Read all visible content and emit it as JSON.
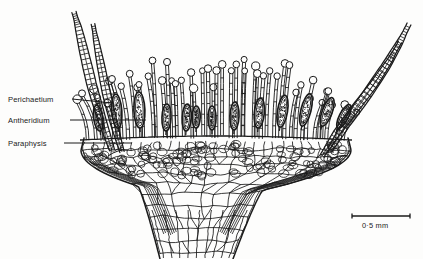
{
  "figure": {
    "background_color": "#fdfdfc",
    "ink_color": "#1a1a1a"
  },
  "labels": [
    {
      "id": "perichaetium",
      "text": "Perichaetium",
      "x": 8,
      "y": 95,
      "leader": {
        "x1": 72,
        "y1": 99,
        "x2": 112,
        "y2": 103
      }
    },
    {
      "id": "antheridium",
      "text": "Antheridium",
      "x": 8,
      "y": 116,
      "leader": {
        "x1": 70,
        "y1": 120,
        "x2": 146,
        "y2": 120
      }
    },
    {
      "id": "paraphysis",
      "text": "Paraphysis",
      "x": 8,
      "y": 139,
      "leader": {
        "x1": 64,
        "y1": 143,
        "x2": 132,
        "y2": 143
      }
    }
  ],
  "scale_bar": {
    "caption": "0·5 mm",
    "x1": 352,
    "x2": 410,
    "y": 216,
    "tick_height": 5,
    "caption_x": 362,
    "caption_y": 221
  },
  "structures": {
    "receptacle": {
      "name": "cup-shaped receptacle",
      "cells": "polygonal parenchyma"
    },
    "stalk": {
      "name": "stem",
      "cells": "elongated vertical cells"
    },
    "paraphyses": {
      "name": "paraphysis",
      "description": "slender multicellular filament with swollen rounded tip",
      "count": 46
    },
    "antheridia": {
      "name": "antheridium",
      "description": "elongated stippled ovoid body",
      "count": 13
    },
    "perichaetial_leaves": {
      "name": "perichaetial leaf",
      "description": "narrow recurved leaf with ladder-like cells",
      "count": 4
    }
  }
}
